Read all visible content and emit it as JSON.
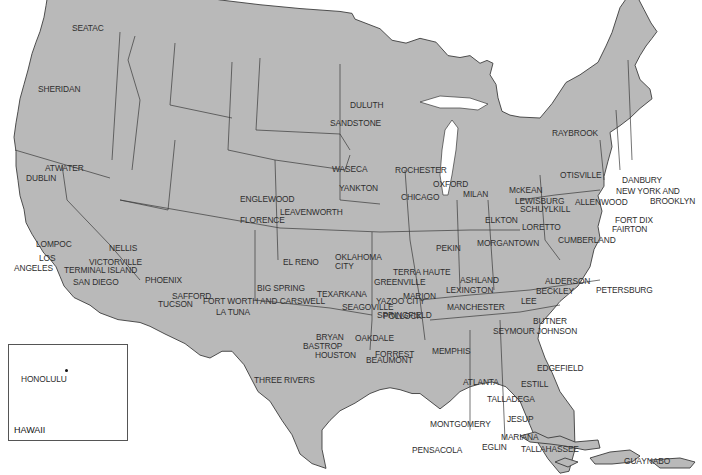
{
  "map": {
    "title": "",
    "inset": {
      "label": "HAWAII",
      "city": "HONOLULU"
    },
    "cities": [
      {
        "name": "SEATAC",
        "x": 68,
        "y": 22,
        "lx": 72,
        "ly": 30
      },
      {
        "name": "SHERIDAN",
        "x": 44,
        "y": 82,
        "lx": 38,
        "ly": 91
      },
      {
        "name": "ATWATER",
        "x": 39,
        "y": 176,
        "lx": 45,
        "ly": 170
      },
      {
        "name": "DUBLIN",
        "x": 33,
        "y": 176,
        "lx": 26,
        "ly": 180
      },
      {
        "name": "LOMPOC",
        "x": 31,
        "y": 252,
        "lx": 36,
        "ly": 246
      },
      {
        "name": "NELLIS",
        "x": 104,
        "y": 254,
        "lx": 109,
        "ly": 250
      },
      {
        "name": "LOS",
        "x": 59,
        "y": 264,
        "lx": 39,
        "ly": 260
      },
      {
        "name": "ANGELES",
        "x": 59,
        "y": 269,
        "lx": 14,
        "ly": 270
      },
      {
        "name": "VICTORVILLE",
        "x": 85,
        "y": 268,
        "lx": 89,
        "ly": 264
      },
      {
        "name": "TERMINAL ISLAND",
        "x": 60,
        "y": 270,
        "lx": 64,
        "ly": 272
      },
      {
        "name": "SAN DIEGO",
        "x": 68,
        "y": 288,
        "lx": 73,
        "ly": 284
      },
      {
        "name": "PHOENIX",
        "x": 141,
        "y": 286,
        "lx": 145,
        "ly": 282
      },
      {
        "name": "SAFFORD",
        "x": 166,
        "y": 301,
        "lx": 172,
        "ly": 298
      },
      {
        "name": "TUCSON",
        "x": 153,
        "y": 309,
        "lx": 158,
        "ly": 306
      },
      {
        "name": "LA TUNA",
        "x": 211,
        "y": 317,
        "lx": 216,
        "ly": 314
      },
      {
        "name": "ENGLEWOOD",
        "x": 234,
        "y": 204,
        "lx": 240,
        "ly": 201
      },
      {
        "name": "FLORENCE",
        "x": 234,
        "y": 225,
        "lx": 240,
        "ly": 222
      },
      {
        "name": "LEAVENWORTH",
        "x": 348,
        "y": 217,
        "lx": 280,
        "ly": 214
      },
      {
        "name": "EL RENO",
        "x": 325,
        "y": 268,
        "lx": 283,
        "ly": 264
      },
      {
        "name": "OKLAHOMA",
        "x": 331,
        "y": 268,
        "lx": 335,
        "ly": 259
      },
      {
        "name": "CITY",
        "x": 331,
        "y": 268,
        "lx": 335,
        "ly": 268
      },
      {
        "name": "BIG SPRING",
        "x": 264,
        "y": 298,
        "lx": 257,
        "ly": 290
      },
      {
        "name": "FORT WORTH AND CARSWELL",
        "x": 332,
        "y": 307,
        "lx": 203,
        "ly": 303
      },
      {
        "name": "TEXARKANA",
        "x": 372,
        "y": 304,
        "lx": 317,
        "ly": 296
      },
      {
        "name": "SEAGOVILLE",
        "x": 338,
        "y": 313,
        "lx": 342,
        "ly": 309
      },
      {
        "name": "YAZOO CITY",
        "x": 430,
        "y": 307,
        "lx": 376,
        "ly": 303
      },
      {
        "name": "POLLOCK",
        "x": 404,
        "y": 314,
        "lx": 383,
        "ly": 318
      },
      {
        "name": "BRYAN",
        "x": 347,
        "y": 347,
        "lx": 316,
        "ly": 339
      },
      {
        "name": "OAKDALE",
        "x": 398,
        "y": 344,
        "lx": 355,
        "ly": 340
      },
      {
        "name": "BASTROP",
        "x": 343,
        "y": 352,
        "lx": 303,
        "ly": 348
      },
      {
        "name": "HOUSTON",
        "x": 358,
        "y": 357,
        "lx": 315,
        "ly": 357
      },
      {
        "name": "BEAUMONT",
        "x": 373,
        "y": 355,
        "lx": 366,
        "ly": 362
      },
      {
        "name": "THREE RIVERS",
        "x": 318,
        "y": 386,
        "lx": 254,
        "ly": 382
      },
      {
        "name": "DULUTH",
        "x": 387,
        "y": 111,
        "lx": 350,
        "ly": 107
      },
      {
        "name": "SANDSTONE",
        "x": 383,
        "y": 129,
        "lx": 330,
        "ly": 125
      },
      {
        "name": "WASECA",
        "x": 372,
        "y": 175,
        "lx": 332,
        "ly": 171
      },
      {
        "name": "ROCHESTER",
        "x": 390,
        "y": 176,
        "lx": 395,
        "ly": 172
      },
      {
        "name": "YANKTON",
        "x": 333,
        "y": 194,
        "lx": 339,
        "ly": 190
      },
      {
        "name": "OXFORD",
        "x": 428,
        "y": 190,
        "lx": 433,
        "ly": 186
      },
      {
        "name": "CHICAGO",
        "x": 444,
        "y": 203,
        "lx": 401,
        "ly": 199
      },
      {
        "name": "MILAN",
        "x": 495,
        "y": 200,
        "lx": 463,
        "ly": 196
      },
      {
        "name": "PEKIN",
        "x": 431,
        "y": 190,
        "lx": 436,
        "ly": 250
      },
      {
        "name": "TERRA HAUTE",
        "x": 455,
        "y": 278,
        "lx": 393,
        "ly": 274
      },
      {
        "name": "GREENVILLE",
        "x": 431,
        "y": 287,
        "lx": 374,
        "ly": 284
      },
      {
        "name": "MARION",
        "x": 442,
        "y": 302,
        "lx": 403,
        "ly": 298
      },
      {
        "name": "SPRINGFIELD",
        "x": 372,
        "y": 320,
        "lx": 377,
        "ly": 317
      },
      {
        "name": "ASHLAND",
        "x": 506,
        "y": 286,
        "lx": 460,
        "ly": 282
      },
      {
        "name": "LEXINGTON",
        "x": 499,
        "y": 295,
        "lx": 446,
        "ly": 292
      },
      {
        "name": "MANCHESTER",
        "x": 505,
        "y": 313,
        "lx": 447,
        "ly": 309
      },
      {
        "name": "FORREST",
        "x": 418,
        "y": 360,
        "lx": 375,
        "ly": 356
      },
      {
        "name": "MEMPHIS",
        "x": 428,
        "y": 357,
        "lx": 432,
        "ly": 353
      },
      {
        "name": "ATLANTA",
        "x": 503,
        "y": 388,
        "lx": 463,
        "ly": 384
      },
      {
        "name": "TALLADEGA",
        "x": 482,
        "y": 404,
        "lx": 487,
        "ly": 401
      },
      {
        "name": "MONTGOMERY",
        "x": 470,
        "y": 424,
        "lx": 430,
        "ly": 426
      },
      {
        "name": "PENSACOLA",
        "x": 469,
        "y": 456,
        "lx": 412,
        "ly": 452
      },
      {
        "name": "EGLIN",
        "x": 477,
        "y": 452,
        "lx": 482,
        "ly": 449
      },
      {
        "name": "MARIANA",
        "x": 496,
        "y": 443,
        "lx": 501,
        "ly": 439
      },
      {
        "name": "TALLAHASSEE",
        "x": 516,
        "y": 455,
        "lx": 521,
        "ly": 451
      },
      {
        "name": "JESUP",
        "x": 536,
        "y": 424,
        "lx": 507,
        "ly": 421
      },
      {
        "name": "EDGEFIELD",
        "x": 533,
        "y": 374,
        "lx": 537,
        "ly": 370
      },
      {
        "name": "ESTILL",
        "x": 552,
        "y": 389,
        "lx": 521,
        "ly": 386
      },
      {
        "name": "COLEMAN",
        "x": 550,
        "y": 491,
        "lx": 555,
        "ly": 487
      },
      {
        "name": "MIAMI",
        "x": 571,
        "y": 540,
        "lx": 545,
        "ly": 537
      },
      {
        "name": "GUAYNABO",
        "x": 680,
        "y": 467,
        "lx": 624,
        "ly": 463
      },
      {
        "name": "RAYBROOK",
        "x": 601,
        "y": 139,
        "lx": 552,
        "ly": 135
      },
      {
        "name": "OTISVILLE",
        "x": 604,
        "y": 183,
        "lx": 560,
        "ly": 177
      },
      {
        "name": "DANBURY",
        "x": 618,
        "y": 186,
        "lx": 622,
        "ly": 182
      },
      {
        "name": "NEW YORK AND",
        "x": 612,
        "y": 193,
        "lx": 616,
        "ly": 193
      },
      {
        "name": "BROOKLYN",
        "x": 612,
        "y": 193,
        "lx": 650,
        "ly": 203
      },
      {
        "name": "McKEAN",
        "x": 548,
        "y": 195,
        "lx": 509,
        "ly": 192
      },
      {
        "name": "LEWISBURG",
        "x": 569,
        "y": 207,
        "lx": 515,
        "ly": 203
      },
      {
        "name": "ALLENWOOD",
        "x": 572,
        "y": 207,
        "lx": 575,
        "ly": 204
      },
      {
        "name": "SCHUYLKILL",
        "x": 570,
        "y": 214,
        "lx": 520,
        "ly": 211
      },
      {
        "name": "ELKTON",
        "x": 528,
        "y": 225,
        "lx": 485,
        "ly": 222
      },
      {
        "name": "LORETTO",
        "x": 563,
        "y": 233,
        "lx": 522,
        "ly": 229
      },
      {
        "name": "FORT DIX",
        "x": 610,
        "y": 225,
        "lx": 615,
        "ly": 222
      },
      {
        "name": "FAIRTON",
        "x": 608,
        "y": 233,
        "lx": 612,
        "ly": 231
      },
      {
        "name": "MORGANTOWN",
        "x": 547,
        "y": 249,
        "lx": 477,
        "ly": 245
      },
      {
        "name": "CUMBERLAND",
        "x": 554,
        "y": 246,
        "lx": 558,
        "ly": 242
      },
      {
        "name": "ALDERSON",
        "x": 541,
        "y": 286,
        "lx": 545,
        "ly": 283
      },
      {
        "name": "BECKLEY",
        "x": 530,
        "y": 297,
        "lx": 536,
        "ly": 293
      },
      {
        "name": "PETERSBURG",
        "x": 592,
        "y": 296,
        "lx": 596,
        "ly": 292
      },
      {
        "name": "LEE",
        "x": 517,
        "y": 313,
        "lx": 521,
        "ly": 303
      },
      {
        "name": "BUTNER",
        "x": 573,
        "y": 328,
        "lx": 533,
        "ly": 323
      },
      {
        "name": "SEYMOUR JOHNSON",
        "x": 579,
        "y": 348,
        "lx": 493,
        "ly": 333
      }
    ]
  }
}
